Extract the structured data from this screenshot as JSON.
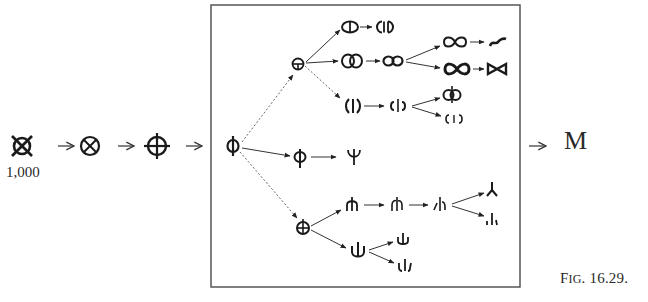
{
  "figure": {
    "caption_prefix": "F",
    "caption_smallcaps": "IG",
    "caption_number": ". 16.29.",
    "start_count": "1,000",
    "result": "M",
    "box": {
      "x": 211,
      "y": 5,
      "width": 309,
      "height": 282,
      "color": "#555555"
    }
  },
  "chain_outside": [
    {
      "id": "s0",
      "glyph": "circle-with-saltire-and-ticks",
      "x": 22,
      "y": 146
    },
    {
      "id": "s1",
      "glyph": "circle-with-saltire",
      "x": 90,
      "y": 146
    },
    {
      "id": "s2",
      "glyph": "circle-with-cross-extended",
      "x": 157,
      "y": 146
    }
  ],
  "tree_nodes": [
    {
      "id": "root",
      "glyph": "phi",
      "x": 233,
      "y": 146
    },
    {
      "id": "a",
      "glyph": "circle-with-horizontal-bar-and-stem",
      "x": 298,
      "y": 64
    },
    {
      "id": "a1",
      "glyph": "circle-with-vertical-bar",
      "x": 350,
      "y": 27
    },
    {
      "id": "a1b",
      "glyph": "split-circle-with-bar",
      "x": 385,
      "y": 27
    },
    {
      "id": "a2",
      "glyph": "double-circle",
      "x": 352,
      "y": 61
    },
    {
      "id": "a2b",
      "glyph": "infinity",
      "x": 393,
      "y": 61
    },
    {
      "id": "a2b1",
      "glyph": "infinity-loops",
      "x": 455,
      "y": 42
    },
    {
      "id": "a2b1b",
      "glyph": "s-curve",
      "x": 498,
      "y": 42
    },
    {
      "id": "a2b2",
      "glyph": "bowtie-thick",
      "x": 457,
      "y": 69
    },
    {
      "id": "a2b2b",
      "glyph": "bowtie",
      "x": 497,
      "y": 69
    },
    {
      "id": "a3",
      "glyph": "parenthesized-bar",
      "x": 353,
      "y": 106
    },
    {
      "id": "a3b",
      "glyph": "c-bar-reversed-c",
      "x": 398,
      "y": 106
    },
    {
      "id": "a3b1",
      "glyph": "circle-pair-with-stem",
      "x": 452,
      "y": 95
    },
    {
      "id": "a3b2",
      "glyph": "c-i-reversed-c",
      "x": 454,
      "y": 119
    },
    {
      "id": "b",
      "glyph": "phi-open",
      "x": 300,
      "y": 157
    },
    {
      "id": "b1",
      "glyph": "psi",
      "x": 354,
      "y": 157
    },
    {
      "id": "c",
      "glyph": "circle-with-plus-stem",
      "x": 303,
      "y": 228
    },
    {
      "id": "c1",
      "glyph": "arch-with-stem",
      "x": 352,
      "y": 205
    },
    {
      "id": "c1b",
      "glyph": "broken-arch-with-stem",
      "x": 397,
      "y": 205
    },
    {
      "id": "c1c",
      "glyph": "split-arch-with-stem",
      "x": 440,
      "y": 205
    },
    {
      "id": "c1c1",
      "glyph": "inverted-y",
      "x": 492,
      "y": 190
    },
    {
      "id": "c1c2",
      "glyph": "three-strokes",
      "x": 492,
      "y": 219
    },
    {
      "id": "c2",
      "glyph": "u-with-stem",
      "x": 358,
      "y": 251
    },
    {
      "id": "c2a",
      "glyph": "psi-small",
      "x": 403,
      "y": 240
    },
    {
      "id": "c2b",
      "glyph": "psi-broken",
      "x": 405,
      "y": 266
    }
  ],
  "edges": [
    {
      "from": "s0",
      "to": "s1",
      "style": "outside"
    },
    {
      "from": "s1",
      "to": "s2",
      "style": "outside"
    },
    {
      "from": "s2",
      "to": "root",
      "style": "outside"
    },
    {
      "from": "root",
      "to": "result",
      "style": "outside"
    },
    {
      "from": "root",
      "to": "a",
      "style": "dotted"
    },
    {
      "from": "root",
      "to": "b",
      "style": "solid"
    },
    {
      "from": "root",
      "to": "c",
      "style": "dotted"
    },
    {
      "from": "a",
      "to": "a1",
      "style": "solid"
    },
    {
      "from": "a",
      "to": "a2",
      "style": "solid"
    },
    {
      "from": "a",
      "to": "a3",
      "style": "dotted"
    },
    {
      "from": "a1",
      "to": "a1b",
      "style": "solid"
    },
    {
      "from": "a2",
      "to": "a2b",
      "style": "solid"
    },
    {
      "from": "a2b",
      "to": "a2b1",
      "style": "solid"
    },
    {
      "from": "a2b",
      "to": "a2b2",
      "style": "solid"
    },
    {
      "from": "a2b1",
      "to": "a2b1b",
      "style": "solid"
    },
    {
      "from": "a2b2",
      "to": "a2b2b",
      "style": "solid"
    },
    {
      "from": "a3",
      "to": "a3b",
      "style": "solid"
    },
    {
      "from": "a3b",
      "to": "a3b1",
      "style": "solid"
    },
    {
      "from": "a3b",
      "to": "a3b2",
      "style": "solid"
    },
    {
      "from": "b",
      "to": "b1",
      "style": "solid"
    },
    {
      "from": "c",
      "to": "c1",
      "style": "solid"
    },
    {
      "from": "c",
      "to": "c2",
      "style": "solid"
    },
    {
      "from": "c1",
      "to": "c1b",
      "style": "solid"
    },
    {
      "from": "c1b",
      "to": "c1c",
      "style": "solid"
    },
    {
      "from": "c1c",
      "to": "c1c1",
      "style": "solid"
    },
    {
      "from": "c1c",
      "to": "c1c2",
      "style": "solid"
    },
    {
      "from": "c2",
      "to": "c2a",
      "style": "solid"
    },
    {
      "from": "c2",
      "to": "c2b",
      "style": "solid"
    }
  ]
}
